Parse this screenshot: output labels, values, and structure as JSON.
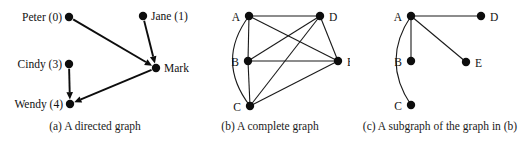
{
  "figure": {
    "width": 530,
    "height": 142,
    "background": "#ffffff",
    "ink_color": "#111111"
  },
  "panels": [
    {
      "id": "a",
      "caption": "(a) A directed graph",
      "graph_type": "directed",
      "nodes": [
        {
          "id": "peter",
          "label": "Peter (0)",
          "x": 69,
          "y": 17,
          "label_anchor": "end",
          "label_x": 62,
          "label_y": 21
        },
        {
          "id": "jane",
          "label": "Jane (1)",
          "x": 143,
          "y": 16,
          "label_anchor": "start",
          "label_x": 151,
          "label_y": 20
        },
        {
          "id": "mark",
          "label": "Mark (2)",
          "x": 156,
          "y": 68,
          "label_anchor": "start",
          "label_x": 164,
          "label_y": 72
        },
        {
          "id": "cindy",
          "label": "Cindy (3)",
          "x": 69,
          "y": 64,
          "label_anchor": "end",
          "label_x": 62,
          "label_y": 68
        },
        {
          "id": "wendy",
          "label": "Wendy (4)",
          "x": 70,
          "y": 104,
          "label_anchor": "end",
          "label_x": 63,
          "label_y": 108
        }
      ],
      "edges": [
        {
          "from": "peter",
          "to": "mark",
          "style": "straight",
          "directed": true
        },
        {
          "from": "jane",
          "to": "mark",
          "style": "straight",
          "directed": true
        },
        {
          "from": "cindy",
          "to": "wendy",
          "style": "straight",
          "directed": true
        },
        {
          "from": "mark",
          "to": "wendy",
          "style": "straight",
          "directed": true
        }
      ]
    },
    {
      "id": "b",
      "caption": "(b) A complete graph",
      "graph_type": "undirected-complete",
      "nodes": [
        {
          "id": "A",
          "label": "A",
          "x": 59,
          "y": 16,
          "label_anchor": "end",
          "label_x": 50,
          "label_y": 21
        },
        {
          "id": "B",
          "label": "B",
          "x": 58,
          "y": 61,
          "label_anchor": "end",
          "label_x": 49,
          "label_y": 66
        },
        {
          "id": "C",
          "label": "C",
          "x": 60,
          "y": 106,
          "label_anchor": "end",
          "label_x": 51,
          "label_y": 111
        },
        {
          "id": "D",
          "label": "D",
          "x": 130,
          "y": 16,
          "label_anchor": "start",
          "label_x": 139,
          "label_y": 21
        },
        {
          "id": "E",
          "label": "E",
          "x": 148,
          "y": 61,
          "label_anchor": "start",
          "label_x": 157,
          "label_y": 66
        }
      ],
      "edges": [
        {
          "from": "A",
          "to": "D",
          "style": "straight",
          "directed": false
        },
        {
          "from": "A",
          "to": "B",
          "style": "straight",
          "directed": false
        },
        {
          "from": "A",
          "to": "E",
          "style": "straight",
          "directed": false
        },
        {
          "from": "A",
          "to": "C",
          "style": "curved-left",
          "directed": false
        },
        {
          "from": "B",
          "to": "C",
          "style": "straight",
          "directed": false
        },
        {
          "from": "B",
          "to": "D",
          "style": "straight",
          "directed": false
        },
        {
          "from": "B",
          "to": "E",
          "style": "straight",
          "directed": false
        },
        {
          "from": "C",
          "to": "D",
          "style": "straight",
          "directed": false
        },
        {
          "from": "C",
          "to": "E",
          "style": "straight",
          "directed": false
        },
        {
          "from": "D",
          "to": "E",
          "style": "straight",
          "directed": false
        }
      ]
    },
    {
      "id": "c",
      "caption": "(c) A subgraph of the graph in (b)",
      "graph_type": "undirected-subgraph",
      "nodes": [
        {
          "id": "A",
          "label": "A",
          "x": 61,
          "y": 16,
          "label_anchor": "end",
          "label_x": 52,
          "label_y": 21
        },
        {
          "id": "B",
          "label": "B",
          "x": 61,
          "y": 61,
          "label_anchor": "end",
          "label_x": 52,
          "label_y": 66
        },
        {
          "id": "C",
          "label": "C",
          "x": 61,
          "y": 105,
          "label_anchor": "end",
          "label_x": 52,
          "label_y": 110
        },
        {
          "id": "D",
          "label": "D",
          "x": 131,
          "y": 16,
          "label_anchor": "start",
          "label_x": 140,
          "label_y": 21
        },
        {
          "id": "E",
          "label": "E",
          "x": 116,
          "y": 62,
          "label_anchor": "start",
          "label_x": 125,
          "label_y": 67
        }
      ],
      "edges": [
        {
          "from": "A",
          "to": "D",
          "style": "straight",
          "directed": false
        },
        {
          "from": "A",
          "to": "B",
          "style": "straight",
          "directed": false
        },
        {
          "from": "A",
          "to": "E",
          "style": "straight",
          "directed": false
        },
        {
          "from": "A",
          "to": "C",
          "style": "curved-left",
          "directed": false
        }
      ]
    }
  ]
}
